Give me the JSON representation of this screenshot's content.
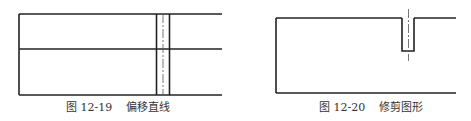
{
  "figures": [
    {
      "id": "fig-12-19",
      "number": "图 12-19",
      "title": "偏移直线",
      "description": "Two horizontal bands with offset vertical lines and centerline"
    },
    {
      "id": "fig-12-20",
      "number": "图 12-20",
      "title": "修剪图形",
      "description": "Rectangle outline with trimmed slot and centerline"
    }
  ],
  "colors": {
    "line": "#222222",
    "centerline": "#555555",
    "caption": "#333333"
  }
}
